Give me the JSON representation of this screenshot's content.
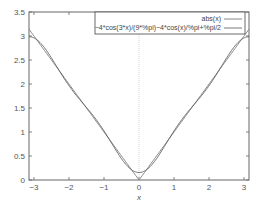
{
  "chart_data": {
    "type": "line",
    "title": "",
    "xlabel": "x",
    "ylabel": "",
    "xlim": [
      -3.14159,
      3.14159
    ],
    "ylim": [
      0,
      3.5
    ],
    "grid": false,
    "legend_position": "upper right",
    "x_ticks": [
      "-3",
      "-2",
      "-1",
      "0",
      "1",
      "2",
      "3"
    ],
    "y_ticks": [
      "0",
      "0.5",
      "1",
      "1.5",
      "2",
      "2.5",
      "3",
      "3.5"
    ],
    "series": [
      {
        "name": "abs(x)",
        "expression": "abs(x)",
        "x": [
          -3.14,
          -2.5,
          -2.0,
          -1.5,
          -1.0,
          -0.5,
          0.0,
          0.5,
          1.0,
          1.5,
          2.0,
          2.5,
          3.14
        ],
        "values": [
          3.14,
          2.5,
          2.0,
          1.5,
          1.0,
          0.5,
          0.0,
          0.5,
          1.0,
          1.5,
          2.0,
          2.5,
          3.14
        ]
      },
      {
        "name": "-4*cos(3*x)/(9*%pi)-4*cos(x)/%pi+%pi/2",
        "expression": "-4*cos(3*x)/(9*%pi)-4*cos(x)/%pi+%pi/2",
        "x": [
          -3.14,
          -2.5,
          -2.0,
          -1.5,
          -1.0,
          -0.5,
          0.0,
          0.5,
          1.0,
          1.5,
          2.0,
          2.5,
          3.14
        ],
        "values": [
          3.03,
          2.56,
          2.0,
          1.47,
          1.04,
          0.49,
          0.12,
          0.49,
          1.04,
          1.47,
          2.0,
          2.56,
          3.03
        ]
      }
    ],
    "annotations": [
      "vertical dotted line at x=0"
    ]
  },
  "legend": {
    "entries": [
      "abs(x)",
      "−4*cos(3*x)/(9*%pi)−4*cos(x)/%pi+%pi/2"
    ]
  },
  "axes": {
    "xlabel": "x",
    "x_ticks": [
      "−3",
      "−2",
      "−1",
      "0",
      "1",
      "2",
      "3"
    ],
    "y_ticks": [
      "0",
      "0.5",
      "1",
      "1.5",
      "2",
      "2.5",
      "3",
      "3.5"
    ]
  },
  "colors": {
    "series1": "#888888",
    "series2": "#555555",
    "axis": "#666666",
    "zero_line": "#bbbbbb"
  }
}
